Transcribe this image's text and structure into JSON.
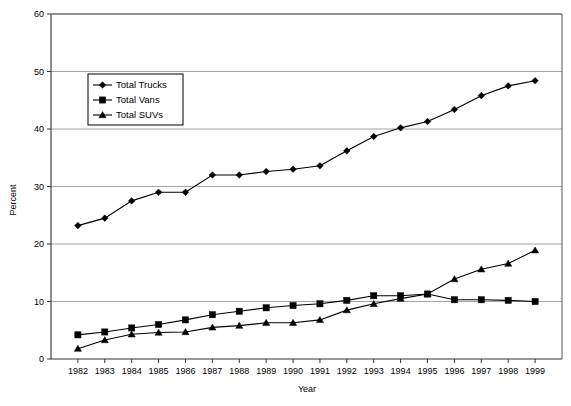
{
  "chart_data": {
    "type": "line",
    "title": "",
    "xlabel": "Year",
    "ylabel": "Percent",
    "grid": "horizontal",
    "legend_position": "upper-left-inside",
    "xlim": [
      1982,
      1999
    ],
    "ylim": [
      0,
      60
    ],
    "yticks": [
      0,
      10,
      20,
      30,
      40,
      50,
      60
    ],
    "categories": [
      "1982",
      "1983",
      "1984",
      "1985",
      "1986",
      "1987",
      "1988",
      "1989",
      "1990",
      "1991",
      "1992",
      "1993",
      "1994",
      "1995",
      "1996",
      "1997",
      "1998",
      "1999"
    ],
    "series": [
      {
        "name": "Total  Trucks",
        "marker": "diamond",
        "values": [
          23.2,
          24.5,
          27.5,
          29.0,
          29.0,
          32.0,
          32.0,
          32.6,
          33.0,
          33.6,
          36.2,
          38.7,
          40.2,
          41.3,
          43.4,
          45.8,
          47.5,
          48.4
        ]
      },
      {
        "name": "Total Vans",
        "marker": "square",
        "values": [
          4.2,
          4.7,
          5.4,
          6.0,
          6.8,
          7.7,
          8.3,
          8.9,
          9.3,
          9.6,
          10.2,
          11.0,
          11.0,
          11.3,
          10.3,
          10.3,
          10.2,
          10.0
        ]
      },
      {
        "name": "Total SUVs",
        "marker": "triangle",
        "values": [
          1.8,
          3.3,
          4.3,
          4.6,
          4.7,
          5.5,
          5.8,
          6.3,
          6.3,
          6.8,
          8.5,
          9.6,
          10.5,
          11.3,
          13.9,
          15.6,
          16.6,
          18.9
        ]
      }
    ]
  },
  "axes": {
    "x_title": "Year",
    "y_title": "Percent",
    "y_tick_labels": [
      "0",
      "10",
      "20",
      "30",
      "40",
      "50",
      "60"
    ],
    "x_tick_labels": [
      "1982",
      "1983",
      "1984",
      "1985",
      "1986",
      "1987",
      "1988",
      "1989",
      "1990",
      "1991",
      "1992",
      "1993",
      "1994",
      "1995",
      "1996",
      "1997",
      "1998",
      "1999"
    ]
  },
  "legend": {
    "entries": [
      {
        "label": "Total  Trucks",
        "marker": "diamond-marker"
      },
      {
        "label": "Total Vans",
        "marker": "square-marker"
      },
      {
        "label": "Total SUVs",
        "marker": "triangle-marker"
      }
    ]
  },
  "colors": {
    "series": "#000000",
    "grid": "#9a9a9a",
    "axis": "#333333",
    "background": "#ffffff"
  }
}
